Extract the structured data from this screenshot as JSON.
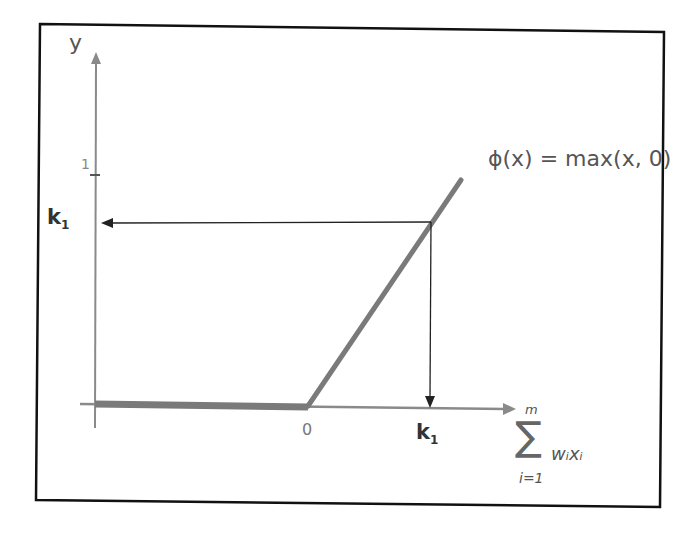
{
  "diagram": {
    "y_axis_label": "y",
    "y_tick_label": "1",
    "origin_label": "0",
    "k1_y_label": "k",
    "k1_y_sub": "1",
    "k1_x_label": "k",
    "k1_x_sub": "1",
    "function_label": "ϕ(x) = max(x, 0)",
    "x_axis_label": {
      "sum_symbol": "∑",
      "upper": "m",
      "lower": "i=1",
      "term": "wᵢxᵢ"
    },
    "colors": {
      "frame": "#111111",
      "axis": "#8a8a8a",
      "relu": "#7a7a7a",
      "arrow": "#222222",
      "text": "#555555"
    }
  }
}
